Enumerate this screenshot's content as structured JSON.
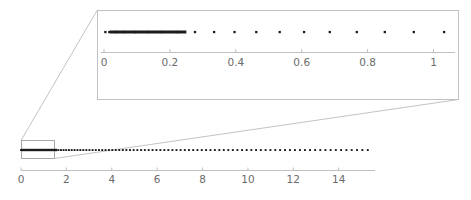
{
  "figure": {
    "title": "",
    "background_color": "#ffffff",
    "dot_color": "#1b1b1b",
    "axis_color": "#b9b9b9",
    "label_color": "#6b6b6b",
    "inset_frame_color": "#bcbcbc",
    "connector_color": "#bcbcbc",
    "zoom_rect_color": "#9e9e9e"
  },
  "main_axis": {
    "name": "main-axis",
    "tick_labels": [
      "0",
      "2",
      "4",
      "6",
      "8",
      "10",
      "12",
      "14"
    ],
    "tick_values": [
      0,
      2,
      4,
      6,
      8,
      10,
      12,
      14
    ],
    "xlim": [
      0,
      15.6
    ],
    "xlabel": "",
    "ylabel": ""
  },
  "inset_axis": {
    "name": "inset-axis",
    "tick_labels": [
      "0",
      "0.2",
      "0.4",
      "0.6",
      "0.8",
      "1"
    ],
    "tick_values": [
      0,
      0.2,
      0.4,
      0.6,
      0.8,
      1.0
    ],
    "xlim": [
      0,
      1.05
    ],
    "xlabel": "",
    "ylabel": ""
  },
  "zoom_region": {
    "name": "zoom-region",
    "x_start": 0,
    "x_end": 1.05,
    "label": ""
  },
  "chart_data": {
    "type": "scatter",
    "title": "",
    "subtitle": "",
    "xlabel": "",
    "ylabel": "",
    "grid": false,
    "legend": [],
    "legend_position": "none",
    "main_panel": {
      "xlim": [
        0,
        15.6
      ],
      "xticks": [
        0,
        2,
        4,
        6,
        8,
        10,
        12,
        14
      ],
      "xticklabels": [
        "0",
        "2",
        "4",
        "6",
        "8",
        "10",
        "12",
        "14"
      ],
      "y_constant": 0,
      "description": "One-dimensional point set plotted on a horizontal line; spacing between successive points grows monotonically from left to right, so points are dense near 0 and sparse near 15.",
      "x": [
        0.004,
        0.016,
        0.036,
        0.062,
        0.094,
        0.132,
        0.175,
        0.223,
        0.276,
        0.334,
        0.396,
        0.462,
        0.533,
        0.607,
        0.685,
        0.767,
        0.852,
        0.94,
        1.032,
        1.127,
        1.225,
        1.326,
        1.43,
        1.537,
        1.646,
        1.758,
        1.873,
        1.99,
        2.11,
        2.232,
        2.357,
        2.484,
        2.613,
        2.744,
        2.878,
        3.014,
        3.152,
        3.292,
        3.434,
        3.578,
        3.724,
        3.872,
        4.022,
        4.174,
        4.328,
        4.484,
        4.641,
        4.801,
        4.962,
        5.125,
        5.29,
        5.456,
        5.625,
        5.795,
        5.966,
        6.14,
        6.315,
        6.491,
        6.67,
        6.85,
        7.031,
        7.215,
        7.399,
        7.586,
        7.774,
        7.963,
        8.154,
        8.347,
        8.541,
        8.737,
        8.934,
        9.133,
        9.333,
        9.535,
        9.738,
        9.943,
        10.149,
        10.357,
        10.566,
        10.776,
        10.988,
        11.202,
        11.417,
        11.633,
        11.851,
        12.07,
        12.29,
        12.512,
        12.735,
        12.96,
        13.186,
        13.413,
        13.642,
        13.872,
        14.103,
        14.336,
        14.57,
        14.805,
        15.042,
        15.28
      ]
    },
    "inset_panel": {
      "xlim": [
        0,
        1.05
      ],
      "xticks": [
        0,
        0.2,
        0.4,
        0.6,
        0.8,
        1.0
      ],
      "xticklabels": [
        "0",
        "0.2",
        "0.4",
        "0.6",
        "0.8",
        "1"
      ],
      "y_constant": 0,
      "description": "Magnified view of the interval [0, 1] of the same point set; the leftmost points merge into a solid bar because of their density.",
      "x": [
        0.004,
        0.016,
        0.036,
        0.062,
        0.094,
        0.132,
        0.175,
        0.223,
        0.276,
        0.334,
        0.396,
        0.462,
        0.533,
        0.607,
        0.685,
        0.767,
        0.852,
        0.94,
        1.032
      ]
    }
  }
}
